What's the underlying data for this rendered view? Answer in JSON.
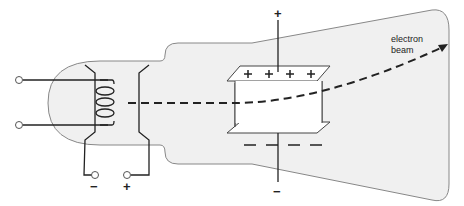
{
  "diagram": {
    "labels": {
      "beam": "electron\nbeam",
      "beam_line1": "electron",
      "beam_line2": "beam",
      "cathode_terminal": "−",
      "anode_terminal": "+",
      "top_plate_terminal": "+",
      "bottom_plate_terminal": "−",
      "top_plate_charges": "+ + + +",
      "bottom_plate_charges": "— — — —"
    },
    "colors": {
      "tube_fill": "#f0f0f0",
      "outline": "#777777",
      "wire": "#222222",
      "plate_fill": "#ffffff"
    }
  }
}
